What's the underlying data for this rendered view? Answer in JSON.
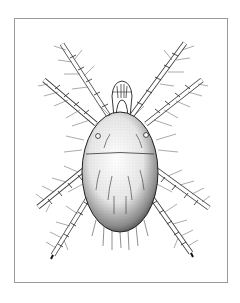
{
  "figure": {
    "style": "black ink stipple drawing",
    "colors": {
      "background": "#ffffff",
      "frame": "#9a9a9a",
      "ink": "#1a1a1a"
    },
    "parts": [
      "gnathosoma",
      "idiosoma",
      "leg-pair-1",
      "leg-pair-2",
      "leg-pair-3",
      "leg-pair-4",
      "setae",
      "eye-spots"
    ]
  }
}
